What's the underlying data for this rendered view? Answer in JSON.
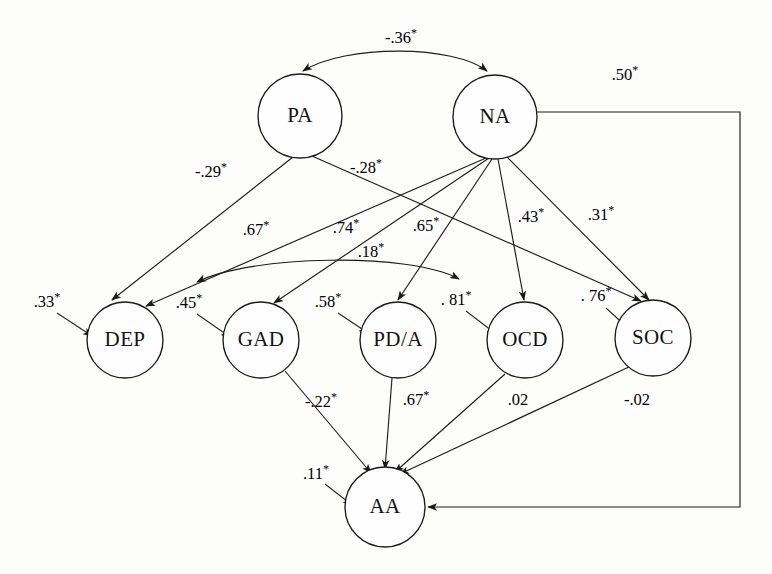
{
  "figure": {
    "type": "path-diagram",
    "title": "",
    "note_significance_marker": "*",
    "stroke_color": "#1c1c1c",
    "node_fill": "#fefefe",
    "background": "#fdfdfc"
  },
  "nodes": [
    {
      "id": "PA",
      "label": "PA",
      "cx": 300,
      "cy": 116,
      "r": 42,
      "row": "top"
    },
    {
      "id": "NA",
      "label": "NA",
      "cx": 495,
      "cy": 117,
      "r": 42,
      "row": "top"
    },
    {
      "id": "DEP",
      "label": "DEP",
      "cx": 125,
      "cy": 340,
      "r": 38,
      "row": "middle"
    },
    {
      "id": "GAD",
      "label": "GAD",
      "cx": 261,
      "cy": 340,
      "r": 38,
      "row": "middle"
    },
    {
      "id": "PDA",
      "label": "PD/A",
      "cx": 398,
      "cy": 340,
      "r": 38,
      "row": "middle"
    },
    {
      "id": "OCD",
      "label": "OCD",
      "cx": 525,
      "cy": 340,
      "r": 38,
      "row": "middle"
    },
    {
      "id": "SOC",
      "label": "SOC",
      "cx": 653,
      "cy": 338,
      "r": 38,
      "row": "middle"
    },
    {
      "id": "AA",
      "label": "AA",
      "cx": 385,
      "cy": 507,
      "r": 40,
      "row": "bottom"
    }
  ],
  "paths": [
    {
      "from": "PA",
      "to": "NA",
      "coefficient": "-.36",
      "significant": true,
      "label": "-.36*",
      "style": "curved-double-arrow",
      "label_x": 401,
      "label_y": 38
    },
    {
      "from": "PA",
      "to": "DEP",
      "coefficient": "-.29",
      "significant": true,
      "label": "-.29*",
      "style": "straight",
      "label_x": 211,
      "label_y": 172
    },
    {
      "from": "PA",
      "to": "SOC",
      "coefficient": "-.28",
      "significant": true,
      "label": "-.28*",
      "style": "straight",
      "label_x": 366,
      "label_y": 168
    },
    {
      "from": "NA",
      "to": "DEP",
      "coefficient": ".67",
      "significant": true,
      "label": ".67*",
      "style": "straight",
      "label_x": 256,
      "label_y": 230
    },
    {
      "from": "NA",
      "to": "GAD",
      "coefficient": ".74",
      "significant": true,
      "label": ".74*",
      "style": "straight",
      "label_x": 346,
      "label_y": 228
    },
    {
      "from": "NA",
      "to": "PDA",
      "coefficient": ".65",
      "significant": true,
      "label": ".65*",
      "style": "straight",
      "label_x": 426,
      "label_y": 226
    },
    {
      "from": "NA",
      "to": "OCD",
      "coefficient": ".43",
      "significant": true,
      "label": ".43*",
      "style": "straight",
      "label_x": 531,
      "label_y": 217
    },
    {
      "from": "NA",
      "to": "SOC",
      "coefficient": ".31",
      "significant": true,
      "label": ".31*",
      "style": "straight",
      "label_x": 601,
      "label_y": 215
    },
    {
      "from": "NA",
      "to": "AA",
      "coefficient": ".50",
      "significant": true,
      "label": ".50*",
      "style": "orthogonal-right",
      "label_x": 625,
      "label_y": 75
    },
    {
      "from": "GAD",
      "to": "PDA",
      "coefficient": ".18",
      "significant": true,
      "label": ".18*",
      "style": "curved-double-arrow",
      "label_x": 371,
      "label_y": 252
    },
    {
      "from": "GAD",
      "to": "AA",
      "coefficient": "-.22",
      "significant": true,
      "label": "-.22*",
      "style": "straight",
      "label_x": 321,
      "label_y": 402
    },
    {
      "from": "PDA",
      "to": "AA",
      "coefficient": ".67",
      "significant": true,
      "label": ".67*",
      "style": "straight",
      "label_x": 416,
      "label_y": 400
    },
    {
      "from": "OCD",
      "to": "AA",
      "coefficient": ".02",
      "significant": false,
      "label": ".02",
      "style": "straight",
      "label_x": 518,
      "label_y": 400
    },
    {
      "from": "SOC",
      "to": "AA",
      "coefficient": "-.02",
      "significant": false,
      "label": "-.02",
      "style": "straight",
      "label_x": 637,
      "label_y": 400
    }
  ],
  "residuals": [
    {
      "target": "DEP",
      "coefficient": ".33",
      "significant": true,
      "label": ".33*",
      "label_x": 47,
      "label_y": 302
    },
    {
      "target": "GAD",
      "coefficient": ".45",
      "significant": true,
      "label": ".45*",
      "label_x": 189,
      "label_y": 303
    },
    {
      "target": "PDA",
      "coefficient": ".58",
      "significant": true,
      "label": ".58*",
      "label_x": 328,
      "label_y": 302
    },
    {
      "target": "OCD",
      "coefficient": ".81",
      "significant": true,
      "label": ". 81*",
      "label_x": 456,
      "label_y": 300
    },
    {
      "target": "SOC",
      "coefficient": ".76",
      "significant": true,
      "label": ". 76*",
      "label_x": 596,
      "label_y": 296
    },
    {
      "target": "AA",
      "coefficient": ".11",
      "significant": true,
      "label": ".11*",
      "label_x": 316,
      "label_y": 474
    }
  ]
}
